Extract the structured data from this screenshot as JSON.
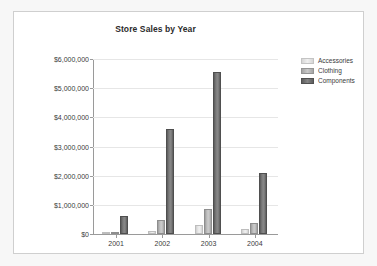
{
  "chart_data": {
    "type": "bar",
    "title": "Store Sales by Year",
    "xlabel": "",
    "ylabel": "",
    "categories": [
      "2001",
      "2002",
      "2003",
      "2004"
    ],
    "series": [
      {
        "name": "Accessories",
        "color": "#e9e9e9",
        "values": [
          20000,
          93000,
          293000,
          163000
        ]
      },
      {
        "name": "Clothing",
        "color": "#c3c3c3",
        "values": [
          34000,
          480000,
          853000,
          383000
        ]
      },
      {
        "name": "Components",
        "color": "#7e7e7e",
        "values": [
          613000,
          3605000,
          5550000,
          2090000
        ]
      }
    ],
    "ylim": [
      0,
      6000000
    ],
    "yticks": [
      0,
      1000000,
      2000000,
      3000000,
      4000000,
      5000000,
      6000000
    ],
    "ytick_labels": [
      "$0",
      "$1,000,000",
      "$2,000,000",
      "$3,000,000",
      "$4,000,000",
      "$5,000,000",
      "$6,000,000"
    ],
    "grid": true,
    "legend_position": "right"
  },
  "legend": {
    "items": [
      {
        "label": "Accessories"
      },
      {
        "label": "Clothing"
      },
      {
        "label": "Components"
      }
    ]
  }
}
